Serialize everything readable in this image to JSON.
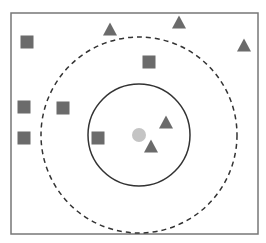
{
  "diagram": {
    "type": "knn-classification-illustration",
    "colors": {
      "frame": "#777777",
      "square": "#6b6b6b",
      "triangle": "#6b6b6b",
      "query": "#c4c4c4",
      "solid_circle": "#333333",
      "dashed_circle": "#333333"
    },
    "frame": {
      "x": 11,
      "y": 13,
      "w": 247,
      "h": 221
    },
    "query_point": {
      "shape": "circle",
      "cx": 139,
      "cy": 135,
      "r": 7
    },
    "solid_circle": {
      "cx": 139,
      "cy": 135,
      "r": 51
    },
    "dashed_circle": {
      "cx": 139,
      "cy": 135,
      "r": 98
    },
    "squares": [
      {
        "x": 27,
        "y": 42
      },
      {
        "x": 149,
        "y": 62
      },
      {
        "x": 24,
        "y": 107
      },
      {
        "x": 63,
        "y": 108
      },
      {
        "x": 24,
        "y": 138
      },
      {
        "x": 98,
        "y": 138
      }
    ],
    "triangles": [
      {
        "x": 110,
        "y": 29
      },
      {
        "x": 179,
        "y": 22
      },
      {
        "x": 244,
        "y": 45
      },
      {
        "x": 166,
        "y": 122
      },
      {
        "x": 151,
        "y": 146
      }
    ]
  }
}
